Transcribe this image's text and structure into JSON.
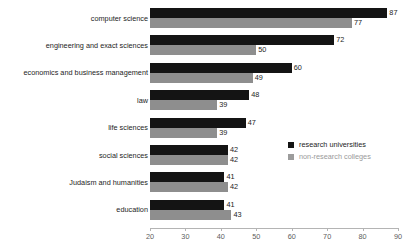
{
  "chart_data": {
    "type": "bar",
    "orientation": "horizontal",
    "title": "",
    "xlabel": "",
    "ylabel": "",
    "xlim": [
      20,
      90
    ],
    "grid": false,
    "legend_position": "middle-right",
    "xticks": [
      20,
      30,
      40,
      50,
      60,
      70,
      80,
      90
    ],
    "categories": [
      "computer science",
      "engineering and exact sciences",
      "economics and business management",
      "law",
      "life sciences",
      "social sciences",
      "Judaism and humanities",
      "education"
    ],
    "series": [
      {
        "name": "research universities",
        "color": "#141414",
        "values": [
          87,
          72,
          60,
          48,
          47,
          42,
          41,
          41
        ]
      },
      {
        "name": "non-research colleges",
        "color": "#8e8e8e",
        "values": [
          77,
          50,
          49,
          39,
          39,
          42,
          42,
          43
        ]
      }
    ]
  },
  "axis": {
    "tick_labels": [
      "20",
      "30",
      "40",
      "50",
      "60",
      "70",
      "80",
      "90"
    ]
  },
  "legend": {
    "items": [
      {
        "label": "research universities",
        "swatch": "#141414"
      },
      {
        "label": "non-research colleges",
        "swatch": "#9c9c9c"
      }
    ]
  },
  "bars": [
    {
      "category": "computer science",
      "dark_value": "87",
      "gray_value": "77"
    },
    {
      "category": "engineering and exact sciences",
      "dark_value": "72",
      "gray_value": "50"
    },
    {
      "category": "economics and business management",
      "dark_value": "60",
      "gray_value": "49"
    },
    {
      "category": "law",
      "dark_value": "48",
      "gray_value": "39"
    },
    {
      "category": "life sciences",
      "dark_value": "47",
      "gray_value": "39"
    },
    {
      "category": "social sciences",
      "dark_value": "42",
      "gray_value": "42"
    },
    {
      "category": "Judaism and humanities",
      "dark_value": "41",
      "gray_value": "42"
    },
    {
      "category": "education",
      "dark_value": "41",
      "gray_value": "43"
    }
  ]
}
